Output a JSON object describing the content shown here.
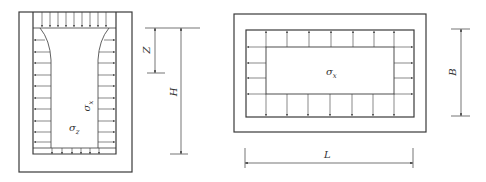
{
  "left_figure": {
    "labels": {
      "sigma_x_sym": "σ",
      "sigma_x_sub": "x",
      "sigma_z_sym": "σ",
      "sigma_z_sub": "z",
      "Z": "Z",
      "H": "H"
    }
  },
  "right_figure": {
    "labels": {
      "sigma_x_sym": "σ",
      "sigma_x_sub": "x",
      "B": "B",
      "L": "L"
    }
  },
  "colors": {
    "line": "#3a3a3a",
    "background": "#ffffff"
  }
}
